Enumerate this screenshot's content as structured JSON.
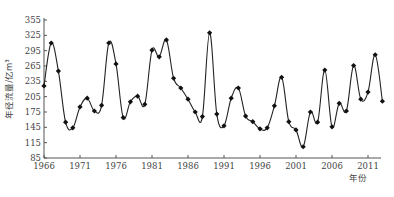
{
  "chart_data": {
    "type": "line",
    "title": "",
    "xlabel": "年份",
    "ylabel": "年径流量/亿m³",
    "x_ticks": [
      1966,
      1971,
      1976,
      1981,
      1986,
      1991,
      1996,
      2001,
      2006,
      2011
    ],
    "y_ticks": [
      85,
      115,
      145,
      175,
      205,
      235,
      265,
      295,
      325,
      355
    ],
    "xlim": [
      1966,
      2014
    ],
    "ylim": [
      85,
      355
    ],
    "grid": false,
    "legend": null,
    "series": [
      {
        "name": "年径流量",
        "marker": "diamond",
        "smooth": true,
        "x": [
          1966,
          1967,
          1968,
          1969,
          1970,
          1971,
          1972,
          1973,
          1974,
          1975,
          1976,
          1977,
          1978,
          1979,
          1980,
          1981,
          1982,
          1983,
          1984,
          1985,
          1986,
          1987,
          1988,
          1989,
          1990,
          1991,
          1992,
          1993,
          1994,
          1995,
          1996,
          1997,
          1998,
          1999,
          2000,
          2001,
          2002,
          2003,
          2004,
          2005,
          2006,
          2007,
          2008,
          2009,
          2010,
          2011,
          2012,
          2013
        ],
        "values": [
          226,
          310,
          255,
          155,
          144,
          185,
          202,
          177,
          188,
          310,
          269,
          164,
          195,
          206,
          190,
          296,
          283,
          316,
          241,
          222,
          200,
          175,
          166,
          330,
          171,
          148,
          202,
          222,
          167,
          156,
          142,
          144,
          187,
          243,
          156,
          140,
          107,
          175,
          155,
          257,
          146,
          192,
          177,
          266,
          200,
          214,
          287,
          196
        ]
      }
    ]
  },
  "labels": {
    "ylabel": "年径流量/亿m³",
    "xlabel": "年份",
    "caption": ""
  }
}
